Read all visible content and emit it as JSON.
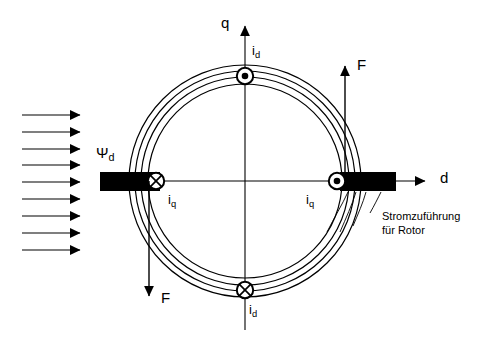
{
  "diagram": {
    "colors": {
      "stroke": "#000000",
      "fill_conductor": "#000000",
      "background": "#ffffff"
    },
    "axes": {
      "vertical": {
        "label": "q",
        "direction": "up"
      },
      "horizontal": {
        "label": "d",
        "direction": "right"
      }
    },
    "flux": {
      "label": "Ψ",
      "label_sub": "d",
      "arrow_count": 9,
      "direction": "right"
    },
    "currents": [
      {
        "position": "top",
        "symbol": "dot",
        "symbol_meaning": "out-of-page",
        "label": "i",
        "label_sub": "d"
      },
      {
        "position": "bottom",
        "symbol": "cross",
        "symbol_meaning": "into-page",
        "label": "i",
        "label_sub": "d"
      },
      {
        "position": "left",
        "symbol": "cross",
        "symbol_meaning": "into-page",
        "label": "i",
        "label_sub": "q"
      },
      {
        "position": "right",
        "symbol": "dot",
        "symbol_meaning": "out-of-page",
        "label": "i",
        "label_sub": "q"
      }
    ],
    "forces": [
      {
        "position": "upper-right",
        "label": "F",
        "direction": "up"
      },
      {
        "position": "lower-left",
        "label": "F",
        "direction": "down"
      }
    ],
    "annotation": {
      "line1": "Stromzuführung",
      "line2": "für Rotor"
    },
    "conductors": [
      {
        "side": "left",
        "name": "rotor-bar-left"
      },
      {
        "side": "right",
        "name": "rotor-bar-right"
      }
    ],
    "rings": [
      {
        "name": "stator-outer",
        "r": 116
      },
      {
        "name": "stator-inner",
        "r": 110
      },
      {
        "name": "rotor-outer",
        "r": 104
      },
      {
        "name": "rotor-inner",
        "r": 97
      }
    ]
  }
}
